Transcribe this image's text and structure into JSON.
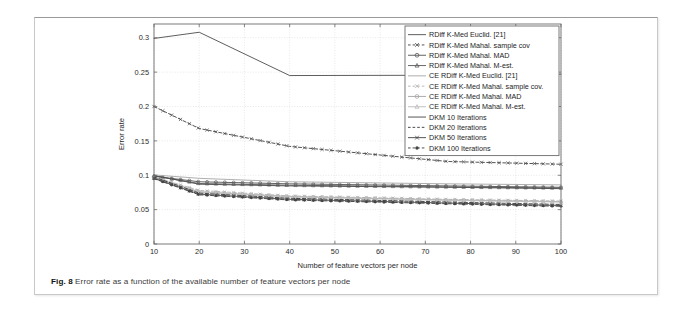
{
  "figure": {
    "caption_label": "Fig. 8",
    "caption_text": " Error rate as a function of the available number of feature vectors per node"
  },
  "chart_data": {
    "type": "line",
    "title": "",
    "xlabel": "Number of feature vectors per node",
    "ylabel": "Error rate",
    "xlim": [
      10,
      100
    ],
    "ylim": [
      0,
      0.32
    ],
    "xticks": [
      10,
      20,
      30,
      40,
      50,
      60,
      70,
      80,
      90,
      100
    ],
    "xticklabels": [
      "10",
      "20",
      "30",
      "40",
      "50",
      "60",
      "70",
      "80",
      "90",
      "100"
    ],
    "yticks": [
      0,
      0.05,
      0.1,
      0.15,
      0.2,
      0.25,
      0.3
    ],
    "yticklabels": [
      "0",
      "0.05",
      "0.1",
      "0.15",
      "0.2",
      "0.25",
      "0.3"
    ],
    "grid": true,
    "legend_position": "upper right",
    "x": [
      10,
      20,
      40,
      75,
      100
    ],
    "series": [
      {
        "name": "RDiff K-Med Euclid. [21]",
        "color": "#555555",
        "style": "solid",
        "marker": "none",
        "values": [
          0.299,
          0.308,
          0.245,
          0.2455,
          0.247
        ]
      },
      {
        "name": "RDiff K-Med Mahal. sample cov",
        "color": "#4a4a4a",
        "style": "dashed",
        "marker": "x",
        "values": [
          0.2,
          0.168,
          0.142,
          0.12,
          0.116
        ]
      },
      {
        "name": "RDiff K-Med Mahal. MAD",
        "color": "#5a5a5a",
        "style": "solid",
        "marker": "circle",
        "values": [
          0.0985,
          0.0905,
          0.0875,
          0.0845,
          0.0825
        ]
      },
      {
        "name": "RDiff K-Med Mahal. M-est.",
        "color": "#606060",
        "style": "solid",
        "marker": "triangle",
        "values": [
          0.099,
          0.088,
          0.0855,
          0.083,
          0.0815
        ]
      },
      {
        "name": "CE RDiff K-Med Euclid. [21]",
        "color": "#aaaaaa",
        "style": "solid",
        "marker": "none",
        "values": [
          0.1005,
          0.0955,
          0.0905,
          0.0875,
          0.086
        ]
      },
      {
        "name": "CE RDiff K-Med Mahal. sample cov.",
        "color": "#b4b4b4",
        "style": "dashed",
        "marker": "x",
        "values": [
          0.0975,
          0.078,
          0.07,
          0.065,
          0.0625
        ]
      },
      {
        "name": "CE RDiff K-Med Mahal. MAD",
        "color": "#a8a8a8",
        "style": "solid",
        "marker": "circle",
        "values": [
          0.0965,
          0.076,
          0.069,
          0.064,
          0.0615
        ]
      },
      {
        "name": "CE RDiff K-Med Mahal. M-est.",
        "color": "#bdbdbd",
        "style": "solid",
        "marker": "triangle",
        "values": [
          0.096,
          0.0755,
          0.0685,
          0.0635,
          0.061
        ]
      },
      {
        "name": "DKM 10 Iterations",
        "color": "#4f4f4f",
        "style": "solid",
        "marker": "none",
        "values": [
          0.0995,
          0.087,
          0.0845,
          0.0825,
          0.0805
        ]
      },
      {
        "name": "DKM 20 Iterations",
        "color": "#3f3f3f",
        "style": "dashed",
        "marker": "none",
        "values": [
          0.0975,
          0.074,
          0.0665,
          0.061,
          0.0575
        ]
      },
      {
        "name": "DKM 50 Iterations",
        "color": "#4a4a4a",
        "style": "solid",
        "marker": "x",
        "values": [
          0.0955,
          0.0725,
          0.065,
          0.0595,
          0.056
        ]
      },
      {
        "name": "DKM 100 Iterations",
        "color": "#444444",
        "style": "dashed",
        "marker": "dot",
        "values": [
          0.095,
          0.0715,
          0.064,
          0.0585,
          0.0548
        ]
      }
    ]
  }
}
